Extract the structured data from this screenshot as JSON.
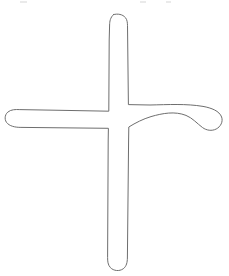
{
  "canvas": {
    "width": 229,
    "height": 276,
    "background_color": "#ffffff",
    "title": "cross-outline-drawing"
  },
  "drawing": {
    "name": "cross-shape-outline",
    "description": "Hand-drawn outline of a cross / plus sign with rounded stroke ends",
    "style": {
      "stroke_color": "#6e6e6e",
      "stroke_width": 1,
      "fill": "none"
    },
    "strokes": {
      "vertical_bar": {
        "name": "vertical-stroke",
        "top_cap_y": 14,
        "bottom_cap_y": 270,
        "left_edge_x": 108,
        "right_edge_x": 128,
        "thickness": 20,
        "cap_style": "round"
      },
      "left_arm": {
        "name": "left-arm-stroke",
        "tip_x": 5,
        "tip_center_y": 119,
        "top_edge_y": 110,
        "bottom_edge_y": 128,
        "thickness": 18,
        "cap_style": "round",
        "curvature": "straight"
      },
      "right_arm": {
        "name": "right-arm-stroke",
        "tip_x": 222,
        "tip_center_y": 120,
        "top_edge_y": 105,
        "bottom_edge_y": 130,
        "thickness": 19,
        "cap_style": "round",
        "curvature": "sweeps-downward"
      }
    },
    "outline_path": "M 113.5 14.6 C 117.8 13.4 122.6 14.3 125.4 17.6 C 127.2 19.8 127.4 22.6 127.5 25.3 L 128.4 104.6 L 150.0 105.0 C 168.0 104.6 186.5 103.6 203.0 106.4 C 211.5 107.9 219.4 111.0 221.6 117.0 C 223.3 121.6 220.6 126.8 216.2 129.0 C 211.8 131.3 206.4 130.4 202.6 127.6 C 197.0 123.5 192.6 118.0 186.0 115.4 C 175.0 111.0 162.6 113.2 151.0 116.6 C 143.0 119.0 135.6 122.8 128.8 127.0 L 128.6 140.0 L 127.4 258.0 C 127.3 262.0 126.6 266.4 123.2 268.8 C 119.4 271.5 113.6 271.0 110.4 267.6 C 107.8 264.9 107.6 261.0 107.6 257.4 L 108.2 140.0 L 108.4 128.3 L 60.0 127.8 L 22.0 127.4 C 17.0 127.4 11.4 127.0 7.6 123.6 C 4.2 120.6 4.4 115.0 7.8 112.1 C 11.0 109.4 15.6 109.4 19.8 109.6 L 60.0 110.3 L 108.8 111.2 L 109.2 40.0 L 109.6 25.0 C 109.7 21.4 110.2 17.6 113.5 14.6 Z",
    "junction": {
      "name": "stroke-junction",
      "center_x": 118,
      "center_y": 119,
      "interior_fill": "#ffffff",
      "note": "union outline, no dividing lines across crossing"
    }
  },
  "artifacts": [
    {
      "name": "scan-artifact-top-left",
      "x": 20,
      "y": 1,
      "width": 7,
      "height": 2
    },
    {
      "name": "scan-artifact-top-mid",
      "x": 140,
      "y": 1,
      "width": 6,
      "height": 2
    },
    {
      "name": "scan-artifact-top-right",
      "x": 166,
      "y": 1,
      "width": 5,
      "height": 2
    }
  ]
}
